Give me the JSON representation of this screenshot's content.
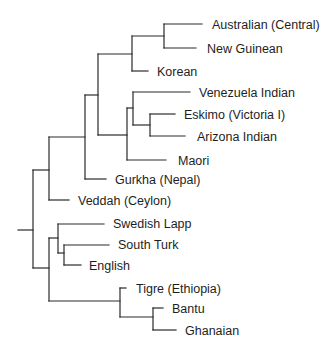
{
  "diagram": {
    "type": "dendrogram",
    "orientation": "left-to-right",
    "leaves": [
      {
        "id": "australian-central",
        "label": "Australian (Central)"
      },
      {
        "id": "new-guinean",
        "label": "New Guinean"
      },
      {
        "id": "korean",
        "label": "Korean"
      },
      {
        "id": "venezuela-indian",
        "label": "Venezuela Indian"
      },
      {
        "id": "eskimo-victoria-i",
        "label": "Eskimo (Victoria I)"
      },
      {
        "id": "arizona-indian",
        "label": "Arizona Indian"
      },
      {
        "id": "maori",
        "label": "Maori"
      },
      {
        "id": "gurkha-nepal",
        "label": "Gurkha (Nepal)"
      },
      {
        "id": "veddah-ceylon",
        "label": "Veddah (Ceylon)"
      },
      {
        "id": "swedish-lapp",
        "label": "Swedish Lapp"
      },
      {
        "id": "south-turk",
        "label": "South Turk"
      },
      {
        "id": "english",
        "label": "English"
      },
      {
        "id": "tigre-ethiopia",
        "label": "Tigre (Ethiopia)"
      },
      {
        "id": "bantu",
        "label": "Bantu"
      },
      {
        "id": "ghanaian",
        "label": "Ghanaian"
      }
    ],
    "structure": "(((((((Australian (Central), New Guinean), Korean), (((Venezuela Indian, (Eskimo (Victoria I), Arizona Indian)), Maori))), Gurkha (Nepal)), Veddah (Ceylon)), ((Swedish Lapp, (South Turk, English)), (Tigre (Ethiopia), (Bantu, Ghanaian))))",
    "line_color": "#2a2a2a",
    "text_color": "#1e1e1e",
    "background": "#ffffff"
  }
}
